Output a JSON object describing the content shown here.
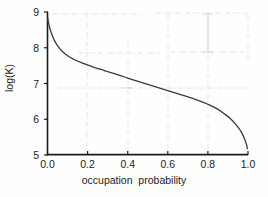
{
  "chart_data": {
    "type": "line",
    "title": "",
    "xlabel": "occupation  probability",
    "ylabel": "log(K)",
    "xlim": [
      0.0,
      1.0
    ],
    "ylim": [
      5,
      9
    ],
    "grid": false,
    "legend": null,
    "xticks": [
      "0.0",
      "0.2",
      "0.4",
      "0.6",
      "0.8",
      "1.0"
    ],
    "xtick_values": [
      0.0,
      0.2,
      0.4,
      0.6,
      0.8,
      1.0
    ],
    "yticks": [
      "9",
      "8",
      "7",
      "6",
      "5"
    ],
    "ytick_values": [
      9,
      8,
      7,
      6,
      5
    ],
    "series": [
      {
        "name": "log(K) vs occupation probability",
        "color": "#3a3a3a",
        "x": [
          0.0,
          0.01,
          0.02,
          0.035,
          0.05,
          0.07,
          0.09,
          0.11,
          0.14,
          0.17,
          0.2,
          0.24,
          0.28,
          0.32,
          0.36,
          0.4,
          0.44,
          0.48,
          0.52,
          0.56,
          0.6,
          0.64,
          0.68,
          0.72,
          0.76,
          0.8,
          0.84,
          0.88,
          0.91,
          0.94,
          0.96,
          0.975,
          0.985,
          0.992,
          0.997
        ],
        "y": [
          8.85,
          8.58,
          8.4,
          8.2,
          8.06,
          7.92,
          7.82,
          7.74,
          7.65,
          7.58,
          7.52,
          7.44,
          7.37,
          7.3,
          7.23,
          7.15,
          7.08,
          7.01,
          6.94,
          6.87,
          6.8,
          6.73,
          6.66,
          6.59,
          6.51,
          6.42,
          6.31,
          6.16,
          6.03,
          5.85,
          5.7,
          5.55,
          5.42,
          5.3,
          5.18
        ]
      }
    ]
  },
  "axes": {
    "y_title": "log(K)",
    "x_title": "occupation  probability"
  },
  "artifacts": {
    "description": "faint dash-dot scan gridline marks",
    "color": "#c9c9c9"
  }
}
